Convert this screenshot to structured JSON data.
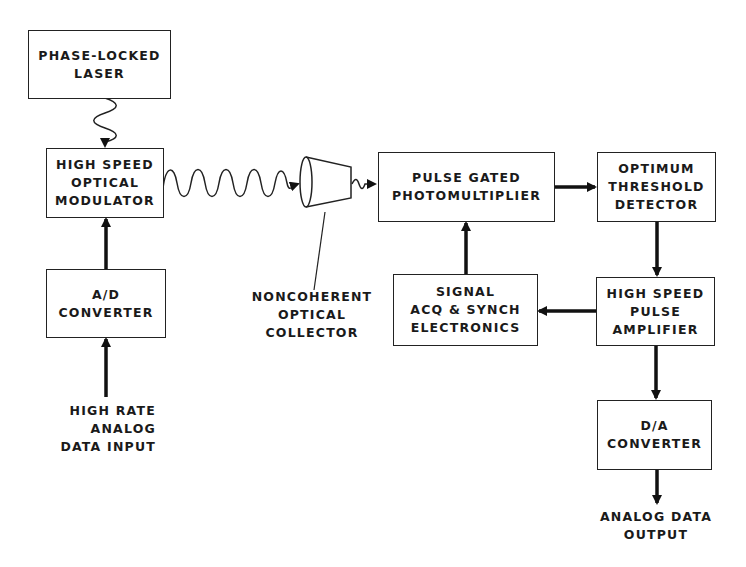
{
  "diagram": {
    "blocks": {
      "laser": [
        "PHASE-LOCKED",
        "LASER"
      ],
      "modulator": [
        "HIGH SPEED",
        "OPTICAL",
        "MODULATOR"
      ],
      "ad_converter": [
        "A/D",
        "CONVERTER"
      ],
      "photomultiplier": [
        "PULSE GATED",
        "PHOTOMULTIPLIER"
      ],
      "threshold_detector": [
        "OPTIMUM",
        "THRESHOLD",
        "DETECTOR"
      ],
      "signal_acq": [
        "SIGNAL",
        "ACQ & SYNCH",
        "ELECTRONICS"
      ],
      "pulse_amplifier": [
        "HIGH SPEED",
        "PULSE",
        "AMPLIFIER"
      ],
      "da_converter": [
        "D/A",
        "CONVERTER"
      ]
    },
    "labels": {
      "collector": [
        "NONCOHERENT",
        "OPTICAL",
        "COLLECTOR"
      ],
      "input": [
        "HIGH RATE",
        "ANALOG",
        "DATA INPUT"
      ],
      "output": [
        "ANALOG DATA",
        "OUTPUT"
      ]
    },
    "connections": [
      {
        "from": "laser",
        "to": "modulator",
        "style": "wavy"
      },
      {
        "from": "ad_converter",
        "to": "modulator",
        "style": "solid"
      },
      {
        "from": "input",
        "to": "ad_converter",
        "style": "solid"
      },
      {
        "from": "modulator",
        "to": "collector",
        "style": "wavy"
      },
      {
        "from": "collector",
        "to": "photomultiplier",
        "style": "wavy"
      },
      {
        "from": "photomultiplier",
        "to": "threshold_detector",
        "style": "solid"
      },
      {
        "from": "threshold_detector",
        "to": "pulse_amplifier",
        "style": "solid"
      },
      {
        "from": "pulse_amplifier",
        "to": "signal_acq",
        "style": "solid"
      },
      {
        "from": "signal_acq",
        "to": "photomultiplier",
        "style": "solid"
      },
      {
        "from": "pulse_amplifier",
        "to": "da_converter",
        "style": "solid"
      },
      {
        "from": "da_converter",
        "to": "output",
        "style": "solid"
      }
    ]
  }
}
